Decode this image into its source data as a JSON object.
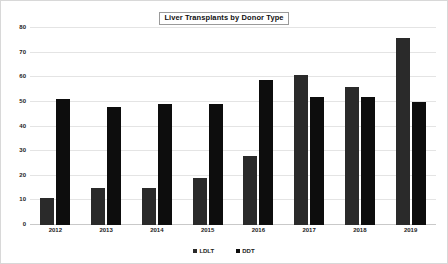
{
  "chart_data": {
    "type": "bar",
    "title": "Liver Transplants by Donor Type",
    "xlabel": "",
    "ylabel": "",
    "categories": [
      "2012",
      "2013",
      "2014",
      "2015",
      "2016",
      "2017",
      "2018",
      "2019"
    ],
    "series": [
      {
        "name": "LDLT",
        "color": "#2a2a2a",
        "values": [
          11,
          15,
          15,
          19,
          28,
          61,
          56,
          76
        ]
      },
      {
        "name": "DDT",
        "color": "#0d0d0d",
        "values": [
          51,
          48,
          49,
          49,
          59,
          52,
          52,
          50
        ]
      }
    ],
    "ylim": [
      0,
      80
    ],
    "yticks": [
      0,
      10,
      20,
      30,
      40,
      50,
      60,
      70,
      80
    ],
    "ytick_labels": [
      "0",
      "10",
      "20",
      "30",
      "40",
      "50",
      "60",
      "70",
      "80"
    ],
    "grid": true,
    "legend_position": "bottom"
  }
}
